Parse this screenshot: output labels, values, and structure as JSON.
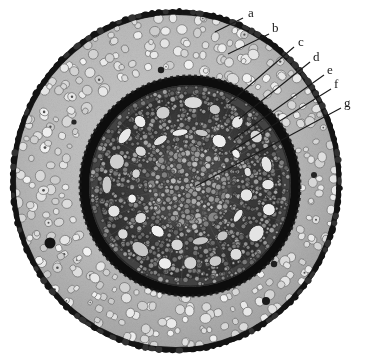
{
  "figure": {
    "name": "root-cross-section-micrograph",
    "kind": "photomicrograph",
    "background_color": "#ffffff",
    "ink_color": "#1a1a1a"
  },
  "specimen": {
    "center_x": 176,
    "center_y": 181,
    "outer_radius_x": 166,
    "outer_radius_y": 172,
    "epidermis_color": "#1c1c1c",
    "cortex_color": "#b9b9b9",
    "cortex_cell_color": "#dcdcdc",
    "endodermis_color": "#111111",
    "stele_color": "#3a3a3a",
    "stele_ground_color": "#2a2a2a",
    "vessel_color": "#e2e2e2",
    "pith_color": "#4a4a4a",
    "stele_center_x": 190,
    "stele_center_y": 186,
    "stele_radius": 102
  },
  "callouts": [
    {
      "id": "a",
      "label": "a",
      "label_x": 248,
      "label_y": 6,
      "line_x1": 243,
      "line_y1": 18,
      "line_x2": 215,
      "line_y2": 32,
      "target": "epidermis"
    },
    {
      "id": "b",
      "label": "b",
      "label_x": 272,
      "label_y": 21,
      "line_x1": 269,
      "line_y1": 34,
      "line_x2": 228,
      "line_y2": 54,
      "target": "cortex"
    },
    {
      "id": "c",
      "label": "c",
      "label_x": 298,
      "label_y": 35,
      "line_x1": 294,
      "line_y1": 47,
      "line_x2": 228,
      "line_y2": 104,
      "target": "endodermis"
    },
    {
      "id": "d",
      "label": "d",
      "label_x": 313,
      "label_y": 50,
      "line_x1": 310,
      "line_y1": 62,
      "line_x2": 239,
      "line_y2": 119,
      "target": "pericycle"
    },
    {
      "id": "e",
      "label": "e",
      "label_x": 327,
      "label_y": 63,
      "line_x1": 324,
      "line_y1": 75,
      "line_x2": 234,
      "line_y2": 139,
      "target": "phloem"
    },
    {
      "id": "f",
      "label": "f",
      "label_x": 334,
      "label_y": 77,
      "line_x1": 331,
      "line_y1": 89,
      "line_x2": 230,
      "line_y2": 152,
      "target": "metaxylem-vessel"
    },
    {
      "id": "g",
      "label": "g",
      "label_x": 344,
      "label_y": 96,
      "line_x1": 341,
      "line_y1": 108,
      "line_x2": 196,
      "line_y2": 186,
      "target": "pith"
    }
  ]
}
